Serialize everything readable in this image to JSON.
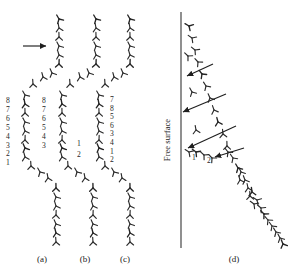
{
  "figure": {
    "type": "scientific-diagram",
    "background_color": "#ffffff",
    "ink_color": "#2b2b2b",
    "glyph_name": "dislocation-symbol",
    "glyph_count_total": 118
  },
  "panels": [
    {
      "id": "a",
      "caption": "(a)",
      "caption_x": 42,
      "caption_y": 262,
      "left_numbers": [
        "8",
        "7",
        "6",
        "5",
        "4",
        "3",
        "2",
        "1"
      ],
      "right_numbers": [],
      "has_push_arrow": true,
      "push_arrow": {
        "x1": 23,
        "y1": 46,
        "x2": 46,
        "y2": 46,
        "direction": "right"
      }
    },
    {
      "id": "b",
      "caption": "(b)",
      "caption_x": 85,
      "caption_y": 262,
      "left_numbers": [
        "8",
        "7",
        "6",
        "5",
        "4",
        "3"
      ],
      "right_numbers": [
        "1",
        "2"
      ],
      "has_push_arrow": false
    },
    {
      "id": "c",
      "caption": "(c)",
      "caption_x": 125,
      "caption_y": 262,
      "left_numbers": [],
      "right_numbers": [
        "7",
        "8",
        "5",
        "6",
        "3",
        "4",
        "1",
        "2"
      ],
      "has_push_arrow": false
    },
    {
      "id": "d",
      "caption": "(d)",
      "caption_x": 234,
      "caption_y": 262,
      "free_surface_label": "Free surface",
      "free_surface_label_x": 170,
      "free_surface_label_y": 140,
      "surface_line": {
        "x": 181,
        "y1": 12,
        "y2": 248
      },
      "arc_numbers": [
        "1",
        "2"
      ],
      "arrow_count": 4,
      "arrow_direction": "left-down-to-surface"
    }
  ],
  "panel_a_numbers_pos": {
    "x": 8,
    "y_start": 103,
    "spacing": 8.9
  },
  "panel_b_left_numbers_pos": {
    "x": 44,
    "y_start": 103,
    "spacing": 8.9
  },
  "panel_b_right_numbers_pos": {
    "x": 79,
    "y_start": 146,
    "spacing": 10.5
  },
  "panel_c_numbers_pos": {
    "x": 112,
    "y_start": 102,
    "spacing": 8.6
  },
  "panel_d_numbers_pos": {
    "x": 196,
    "y_start": 158,
    "spacing": 0
  },
  "panel_d_number_points": [
    {
      "label": "1",
      "x": 194,
      "y": 160
    },
    {
      "label": "2",
      "x": 209,
      "y": 163
    }
  ],
  "chart_data": {
    "type": "scatter",
    "title": "",
    "xlabel": "",
    "ylabel": "",
    "grid": false,
    "legend": "none",
    "series": [
      {
        "name": "panel-a-dislocations",
        "points": [
          [
            59,
            19
          ],
          [
            59,
            28
          ],
          [
            59,
            37
          ],
          [
            59,
            46
          ],
          [
            59,
            55
          ],
          [
            59,
            64
          ],
          [
            52,
            73
          ],
          [
            43,
            77
          ],
          [
            33,
            84
          ],
          [
            25,
            95
          ],
          [
            25,
            104
          ],
          [
            25,
            113
          ],
          [
            25,
            122
          ],
          [
            25,
            131
          ],
          [
            25,
            140
          ],
          [
            25,
            148
          ],
          [
            25,
            157
          ],
          [
            31,
            166
          ],
          [
            40,
            172
          ],
          [
            48,
            178
          ],
          [
            56,
            188
          ],
          [
            56,
            197
          ],
          [
            56,
            206
          ],
          [
            56,
            215
          ],
          [
            56,
            224
          ],
          [
            56,
            233
          ],
          [
            56,
            242
          ]
        ]
      },
      {
        "name": "panel-b-dislocations",
        "points": [
          [
            96,
            19
          ],
          [
            96,
            28
          ],
          [
            96,
            37
          ],
          [
            96,
            46
          ],
          [
            96,
            55
          ],
          [
            96,
            64
          ],
          [
            89,
            73
          ],
          [
            80,
            77
          ],
          [
            70,
            84
          ],
          [
            62,
            95
          ],
          [
            62,
            104
          ],
          [
            62,
            113
          ],
          [
            62,
            122
          ],
          [
            62,
            131
          ],
          [
            62,
            140
          ],
          [
            62,
            148
          ],
          [
            62,
            157
          ],
          [
            68,
            166
          ],
          [
            77,
            172
          ],
          [
            85,
            178
          ],
          [
            93,
            188
          ],
          [
            93,
            197
          ],
          [
            93,
            206
          ],
          [
            93,
            215
          ],
          [
            93,
            224
          ],
          [
            93,
            233
          ],
          [
            93,
            242
          ]
        ]
      },
      {
        "name": "panel-c-dislocations",
        "points": [
          [
            130,
            19
          ],
          [
            130,
            28
          ],
          [
            130,
            37
          ],
          [
            130,
            46
          ],
          [
            130,
            55
          ],
          [
            130,
            64
          ],
          [
            123,
            73
          ],
          [
            114,
            77
          ],
          [
            105,
            84
          ],
          [
            99,
            95
          ],
          [
            99,
            104
          ],
          [
            99,
            113
          ],
          [
            99,
            122
          ],
          [
            99,
            131
          ],
          [
            99,
            140
          ],
          [
            99,
            148
          ],
          [
            99,
            157
          ],
          [
            105,
            166
          ],
          [
            114,
            172
          ],
          [
            122,
            178
          ],
          [
            130,
            188
          ],
          [
            130,
            197
          ],
          [
            130,
            206
          ],
          [
            130,
            215
          ],
          [
            130,
            224
          ],
          [
            130,
            233
          ],
          [
            130,
            242
          ]
        ]
      },
      {
        "name": "panel-d-dislocations",
        "points": [
          [
            189,
            26
          ],
          [
            192,
            38
          ],
          [
            195,
            50
          ],
          [
            188,
            56
          ],
          [
            198,
            62
          ],
          [
            202,
            74
          ],
          [
            206,
            86
          ],
          [
            192,
            92
          ],
          [
            210,
            98
          ],
          [
            214,
            110
          ],
          [
            218,
            122
          ],
          [
            196,
            130
          ],
          [
            223,
            134
          ],
          [
            227,
            146
          ],
          [
            189,
            152
          ],
          [
            196,
            152
          ],
          [
            204,
            155
          ],
          [
            212,
            158
          ],
          [
            228,
            152
          ],
          [
            233,
            158
          ],
          [
            238,
            168
          ],
          [
            241,
            172
          ],
          [
            245,
            180
          ],
          [
            240,
            180
          ],
          [
            248,
            188
          ],
          [
            252,
            192
          ],
          [
            250,
            196
          ],
          [
            257,
            200
          ],
          [
            254,
            204
          ],
          [
            261,
            208
          ],
          [
            264,
            214
          ],
          [
            268,
            220
          ],
          [
            272,
            226
          ],
          [
            276,
            232
          ],
          [
            280,
            238
          ],
          [
            283,
            244
          ]
        ]
      }
    ],
    "arrows": [
      {
        "panel": "a",
        "x1": 23,
        "y1": 46,
        "x2": 46,
        "y2": 46
      },
      {
        "panel": "d",
        "x1": 213,
        "y1": 64,
        "x2": 187,
        "y2": 76
      },
      {
        "panel": "d",
        "x1": 226,
        "y1": 94,
        "x2": 183,
        "y2": 112
      },
      {
        "panel": "d",
        "x1": 236,
        "y1": 126,
        "x2": 188,
        "y2": 148
      },
      {
        "panel": "d",
        "x1": 244,
        "y1": 148,
        "x2": 215,
        "y2": 157
      }
    ]
  }
}
